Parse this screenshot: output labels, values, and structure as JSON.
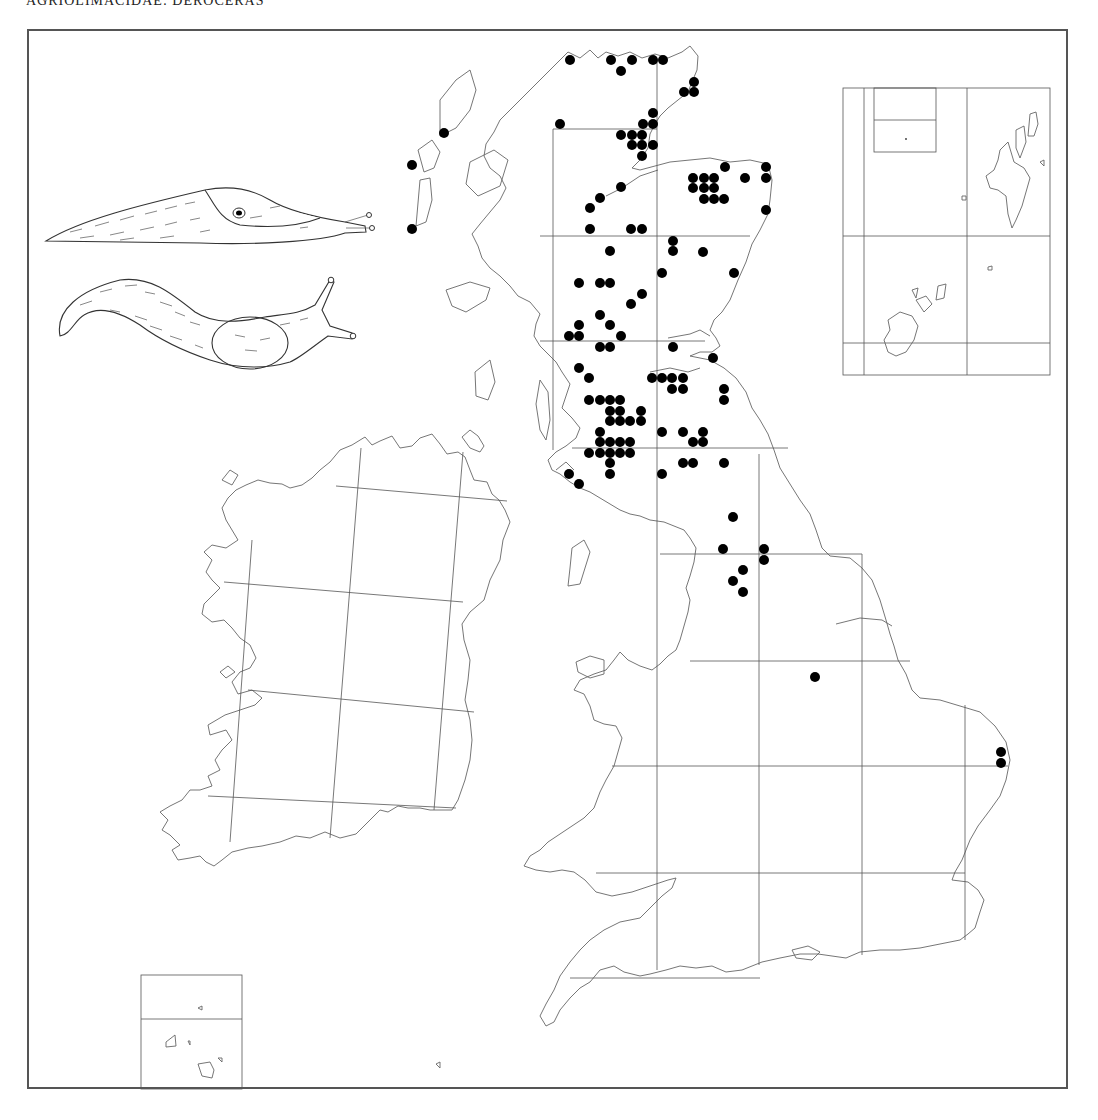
{
  "header": {
    "title": "AGRIOLIMACIDAE: DEROCERAS"
  },
  "chart_data": {
    "type": "scatter",
    "title": "AGRIOLIMACIDAE: DEROCERAS",
    "subtitle": "Distribution map of Britain and Ireland (100 km grid squares, 10 km recording dots)",
    "xlabel": "",
    "ylabel": "",
    "grid": true,
    "legend": "none",
    "insets": [
      "Shetland & Orkney (top right)",
      "Channel Islands (bottom left)"
    ],
    "illustrations": [
      "slug side view (extended)",
      "slug curved view"
    ],
    "dot_color": "#000000",
    "dot_count": 142,
    "points": [
      [
        570,
        60
      ],
      [
        611,
        60
      ],
      [
        621,
        71
      ],
      [
        632,
        60
      ],
      [
        653,
        60
      ],
      [
        663,
        60
      ],
      [
        694,
        82
      ],
      [
        684,
        92
      ],
      [
        694,
        92
      ],
      [
        653,
        113
      ],
      [
        560,
        124
      ],
      [
        643,
        124
      ],
      [
        653,
        124
      ],
      [
        621,
        135
      ],
      [
        632,
        135
      ],
      [
        642,
        135
      ],
      [
        632,
        145
      ],
      [
        642,
        145
      ],
      [
        653,
        145
      ],
      [
        642,
        156
      ],
      [
        725,
        167
      ],
      [
        766,
        167
      ],
      [
        693,
        178
      ],
      [
        704,
        178
      ],
      [
        714,
        178
      ],
      [
        745,
        178
      ],
      [
        766,
        178
      ],
      [
        693,
        188
      ],
      [
        704,
        188
      ],
      [
        714,
        188
      ],
      [
        621,
        187
      ],
      [
        704,
        199
      ],
      [
        714,
        199
      ],
      [
        724,
        199
      ],
      [
        600,
        198
      ],
      [
        590,
        208
      ],
      [
        766,
        210
      ],
      [
        590,
        229
      ],
      [
        631,
        229
      ],
      [
        642,
        229
      ],
      [
        673,
        241
      ],
      [
        610,
        251
      ],
      [
        673,
        251
      ],
      [
        703,
        252
      ],
      [
        662,
        273
      ],
      [
        734,
        273
      ],
      [
        579,
        283
      ],
      [
        600,
        283
      ],
      [
        610,
        283
      ],
      [
        642,
        294
      ],
      [
        631,
        304
      ],
      [
        600,
        315
      ],
      [
        579,
        325
      ],
      [
        610,
        325
      ],
      [
        569,
        336
      ],
      [
        579,
        336
      ],
      [
        621,
        336
      ],
      [
        600,
        347
      ],
      [
        610,
        347
      ],
      [
        673,
        347
      ],
      [
        713,
        358
      ],
      [
        579,
        368
      ],
      [
        589,
        378
      ],
      [
        652,
        378
      ],
      [
        662,
        378
      ],
      [
        672,
        378
      ],
      [
        683,
        378
      ],
      [
        672,
        389
      ],
      [
        683,
        389
      ],
      [
        724,
        389
      ],
      [
        589,
        400
      ],
      [
        600,
        400
      ],
      [
        610,
        400
      ],
      [
        620,
        400
      ],
      [
        724,
        400
      ],
      [
        610,
        411
      ],
      [
        620,
        411
      ],
      [
        641,
        411
      ],
      [
        610,
        421
      ],
      [
        620,
        421
      ],
      [
        630,
        421
      ],
      [
        641,
        421
      ],
      [
        600,
        432
      ],
      [
        662,
        432
      ],
      [
        683,
        432
      ],
      [
        703,
        432
      ],
      [
        600,
        442
      ],
      [
        610,
        442
      ],
      [
        620,
        442
      ],
      [
        630,
        442
      ],
      [
        693,
        442
      ],
      [
        703,
        442
      ],
      [
        589,
        453
      ],
      [
        600,
        453
      ],
      [
        610,
        453
      ],
      [
        620,
        453
      ],
      [
        630,
        453
      ],
      [
        610,
        463
      ],
      [
        683,
        463
      ],
      [
        693,
        463
      ],
      [
        724,
        463
      ],
      [
        569,
        474
      ],
      [
        610,
        474
      ],
      [
        662,
        474
      ],
      [
        579,
        484
      ],
      [
        733,
        517
      ],
      [
        723,
        549
      ],
      [
        764,
        549
      ],
      [
        764,
        560
      ],
      [
        743,
        570
      ],
      [
        733,
        581
      ],
      [
        743,
        592
      ],
      [
        815,
        677
      ],
      [
        1001,
        752
      ],
      [
        1001,
        763
      ],
      [
        444,
        133
      ],
      [
        412,
        165
      ],
      [
        412,
        229
      ]
    ],
    "grid_lines": {
      "gb_vertical_x": [
        553,
        657,
        759,
        862,
        965
      ],
      "gb_horizontal_y": [
        129,
        236,
        341,
        448,
        554,
        661,
        766,
        873
      ]
    }
  },
  "map": {
    "frame": {
      "x": 27,
      "y": 29,
      "width": 1041,
      "height": 1060
    },
    "inset_north": {
      "x": 843,
      "y": 88,
      "width": 207,
      "height": 287
    },
    "inset_south": {
      "x": 141,
      "y": 975,
      "width": 101,
      "height": 114
    }
  }
}
